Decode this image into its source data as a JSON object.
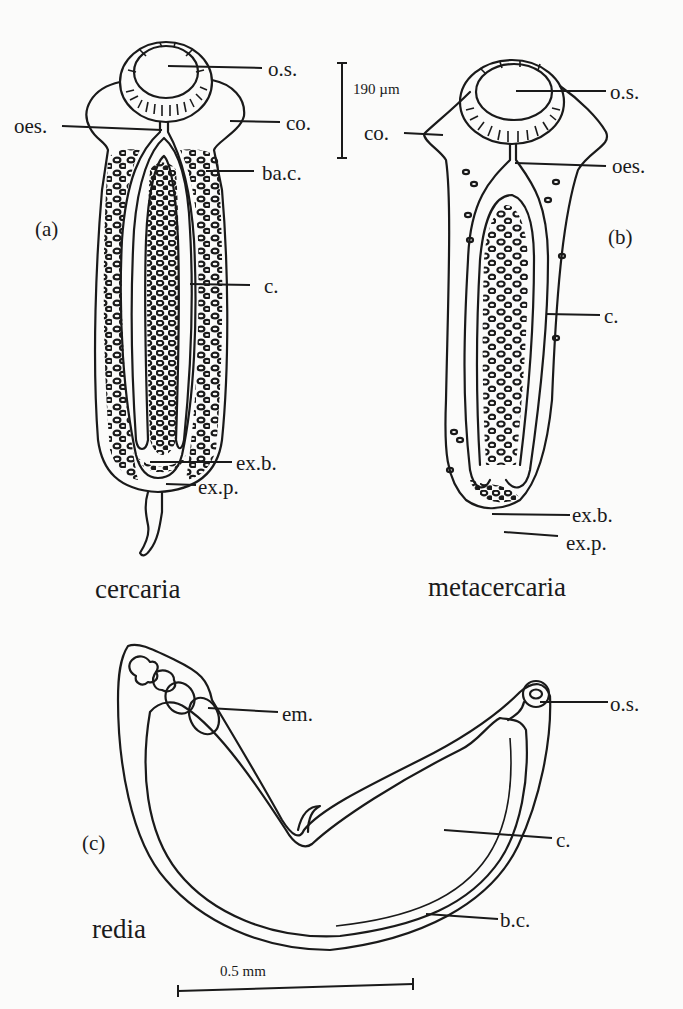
{
  "figure": {
    "panels": [
      {
        "id": "a",
        "panel_label": "(a)",
        "stage_name": "cercaria",
        "scale_bar": "190 µm",
        "labels": {
          "oral_sucker": "o.s.",
          "oesophagus": "oes.",
          "collar": "co.",
          "bacterial_cells": "ba.c.",
          "caecum": "c.",
          "excretory_bladder": "ex.b.",
          "excretory_pore": "ex.p."
        }
      },
      {
        "id": "b",
        "panel_label": "(b)",
        "stage_name": "metacercaria",
        "labels": {
          "oral_sucker": "o.s.",
          "collar": "co.",
          "oesophagus": "oes.",
          "caecum": "c.",
          "excretory_bladder": "ex.b.",
          "excretory_pore": "ex.p."
        }
      },
      {
        "id": "c",
        "panel_label": "(c)",
        "stage_name": "redia",
        "scale_bar": "0.5 mm",
        "labels": {
          "embryos": "em.",
          "oral_sucker": "o.s.",
          "caecum": "c.",
          "body_cavity": "b.c."
        }
      }
    ]
  },
  "colors": {
    "ink": "#1a1a1a",
    "paper": "#fbfbfa"
  }
}
